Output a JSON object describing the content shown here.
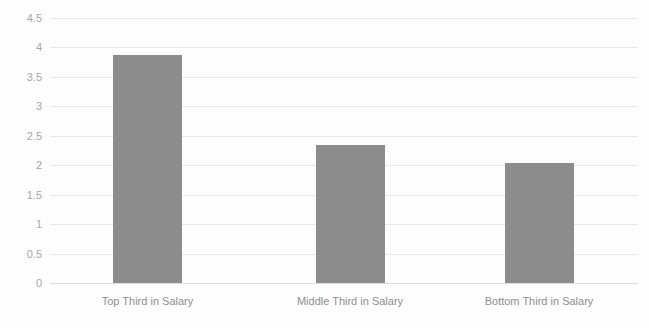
{
  "chart_data": {
    "type": "bar",
    "title": "",
    "xlabel": "",
    "ylabel": "",
    "categories": [
      "Top Third in Salary",
      "Middle Third in Salary",
      "Bottom Third in Salary"
    ],
    "values": [
      3.88,
      2.34,
      2.04
    ],
    "ylim": [
      0,
      4.5
    ],
    "ytick_step": 0.5,
    "yticks": [
      "4.5",
      "4",
      "3.5",
      "3",
      "2.5",
      "2",
      "1.5",
      "1",
      "0.5",
      "0"
    ],
    "ytick_values": [
      4.5,
      4,
      3.5,
      3,
      2.5,
      2,
      1.5,
      1,
      0.5,
      0
    ],
    "grid": true,
    "legend": false,
    "legend_position": "none",
    "series": [
      {
        "name": "",
        "values": [
          3.88,
          2.34,
          2.04
        ]
      }
    ],
    "colors": {
      "bar": "#8c8c8c",
      "gridline": "#e9e9ec",
      "baseline": "#dcdce0",
      "tick_label": "#a6a6aa",
      "category_label": "#8e8e92",
      "background": "#fdfdfd"
    }
  }
}
